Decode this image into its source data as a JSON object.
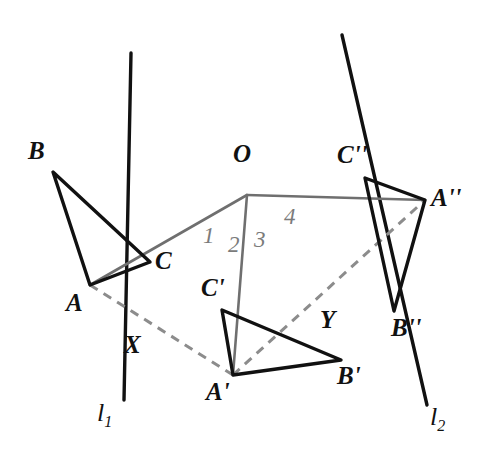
{
  "figure": {
    "type": "geometry-diagram",
    "width": 493,
    "height": 476,
    "background": "#ffffff",
    "colors": {
      "stroke_black": "#111111",
      "stroke_gray": "#6f6f6f",
      "dashed_gray": "#8c8c8c",
      "angle_label": "#7b7b7b"
    }
  },
  "points": {
    "O": {
      "label": "O",
      "x": 247,
      "y": 195,
      "label_x": 233,
      "label_y": 141
    },
    "A": {
      "label": "A",
      "x": 90,
      "y": 285,
      "label_x": 66,
      "label_y": 290
    },
    "B": {
      "label": "B",
      "x": 53,
      "y": 172,
      "label_x": 28,
      "label_y": 138
    },
    "C": {
      "label": "C",
      "x": 150,
      "y": 262,
      "label_x": 155,
      "label_y": 248
    },
    "Ap": {
      "label": "A'",
      "x": 233,
      "y": 375,
      "label_x": 206,
      "label_y": 379
    },
    "Bp": {
      "label": "B'",
      "x": 341,
      "y": 360,
      "label_x": 337,
      "label_y": 363
    },
    "Cp": {
      "label": "C'",
      "x": 222,
      "y": 310,
      "label_x": 201,
      "label_y": 275
    },
    "App": {
      "label": "A''",
      "x": 425,
      "y": 200,
      "label_x": 431,
      "label_y": 185
    },
    "Bpp": {
      "label": "B''",
      "x": 394,
      "y": 311,
      "label_x": 391,
      "label_y": 315
    },
    "Cpp": {
      "label": "C''",
      "x": 365,
      "y": 178,
      "label_x": 337,
      "label_y": 142
    },
    "X": {
      "label": "X",
      "x": 160,
      "y": 330,
      "label_x": 124,
      "label_y": 332
    },
    "Y": {
      "label": "Y",
      "x": 338,
      "y": 302,
      "label_x": 320,
      "label_y": 307
    }
  },
  "lines": [
    {
      "name": "l1",
      "label": "l",
      "subscript": "1",
      "x1": 131,
      "y1": 53,
      "x2": 124,
      "y2": 400,
      "label_x": 97,
      "label_y": 400
    },
    {
      "name": "l2",
      "label": "l",
      "subscript": "2",
      "x1": 342,
      "y1": 35,
      "x2": 427,
      "y2": 405,
      "label_x": 430,
      "label_y": 404
    }
  ],
  "rays_from_O": [
    {
      "name": "ray-O-to-A",
      "to": "A",
      "color": "#6f6f6f"
    },
    {
      "name": "ray-O-to-Ap",
      "to": "Ap",
      "color": "#6f6f6f"
    },
    {
      "name": "ray-O-to-App",
      "to": "App",
      "color": "#6f6f6f"
    }
  ],
  "triangles": [
    {
      "name": "triangle-ABC",
      "vertices": [
        "A",
        "B",
        "C"
      ],
      "style": "solid-black"
    },
    {
      "name": "triangle-ApBpCp",
      "vertices": [
        "Ap",
        "Bp",
        "Cp"
      ],
      "style": "solid-black"
    },
    {
      "name": "triangle-AppBppCpp",
      "vertices": [
        "App",
        "Bpp",
        "Cpp"
      ],
      "style": "solid-black"
    }
  ],
  "dashed_segments": [
    {
      "name": "dashed-A-to-Ap",
      "from": "A",
      "to": "Ap",
      "through": "X"
    },
    {
      "name": "dashed-Ap-to-App",
      "from": "Ap",
      "to": "App",
      "through": "Y"
    }
  ],
  "angles": [
    {
      "label": "1",
      "x": 203,
      "y": 224
    },
    {
      "label": "2",
      "x": 228,
      "y": 233
    },
    {
      "label": "3",
      "x": 254,
      "y": 228
    },
    {
      "label": "4",
      "x": 284,
      "y": 205
    }
  ]
}
